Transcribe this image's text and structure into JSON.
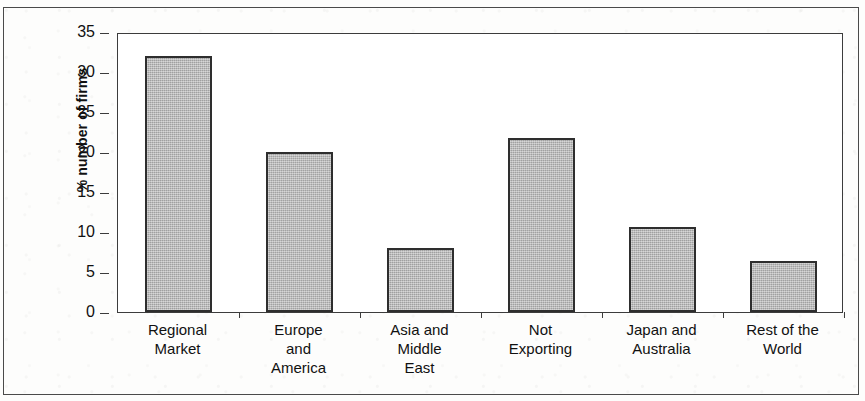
{
  "chart_data": {
    "type": "bar",
    "title": "",
    "xlabel": "",
    "ylabel": "% number of firms",
    "ylim": [
      0,
      35
    ],
    "ytick_labels": [
      "35",
      "30",
      "25",
      "20",
      "15",
      "10",
      "5",
      "0"
    ],
    "ytick_values": [
      35,
      30,
      25,
      20,
      15,
      10,
      5,
      0
    ],
    "grid": false,
    "legend": "none",
    "categories": [
      "Regional Market",
      "Europe and America",
      "Asia and Middle East",
      "Not Exporting",
      "Japan and Australia",
      "Rest of the World"
    ],
    "category_lines": [
      [
        "Regional",
        "Market"
      ],
      [
        "Europe",
        "and",
        "America"
      ],
      [
        "Asia and",
        "Middle",
        "East"
      ],
      [
        "Not",
        "Exporting"
      ],
      [
        "Japan and",
        "Australia"
      ],
      [
        "Rest of the",
        "World"
      ]
    ],
    "values": [
      32,
      20,
      8,
      21.8,
      10.6,
      6.4
    ],
    "bar_fill_color": "#b4b4b4",
    "bar_edge_color": "#2e2e2e",
    "axis_color": "#3c3c3c",
    "background_color": "#ffffff"
  }
}
